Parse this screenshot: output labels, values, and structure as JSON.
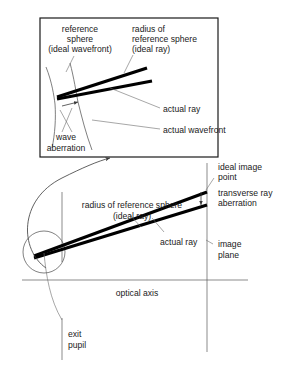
{
  "figure": {
    "background_color": "#ffffff",
    "ink_color": "#000000",
    "leader_color": "#4a4a4a"
  },
  "inset": {
    "name": "magnified-detail-box",
    "labels": {
      "reference_sphere": "reference",
      "reference_sphere_2": "sphere",
      "reference_sphere_3": "(ideal wavefront)",
      "radius_1": "radius of",
      "radius_2": "reference sphere",
      "radius_3": "(ideal ray)",
      "actual_ray": "actual ray",
      "actual_wavefront": "actual wavefront",
      "wave_aberration_1": "wave",
      "wave_aberration_2": "aberration"
    }
  },
  "main": {
    "name": "main-optical-layout",
    "labels": {
      "radius_1": "radius of reference sphere",
      "radius_2": "(ideal ray)",
      "actual_ray": "actual ray",
      "ideal_image_point_1": "ideal image",
      "ideal_image_point_2": "point",
      "transverse_1": "transverse ray",
      "transverse_2": "aberration",
      "image_plane_1": "image",
      "image_plane_2": "plane",
      "optical_axis": "optical axis",
      "exit_pupil_1": "exit",
      "exit_pupil_2": "pupil"
    }
  }
}
